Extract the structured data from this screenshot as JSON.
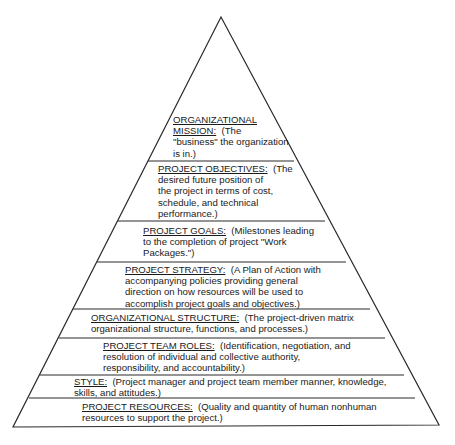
{
  "diagram": {
    "type": "pyramid",
    "line_color": "#2a2a2a",
    "layers": [
      {
        "id": "mission",
        "lines": [
          {
            "head": "ORGANIZATIONAL",
            "text": ""
          },
          {
            "head": "MISSION:",
            "text": "  (The"
          },
          {
            "head": "",
            "text": "\"business\" the organization"
          },
          {
            "head": "",
            "text": "is in.)"
          }
        ]
      },
      {
        "id": "objectives",
        "lines": [
          {
            "head": "PROJECT OBJECTIVES:",
            "text": "  (The"
          },
          {
            "head": "",
            "text": "desired future position of"
          },
          {
            "head": "",
            "text": "the project in terms of cost,"
          },
          {
            "head": "",
            "text": "schedule, and technical"
          },
          {
            "head": "",
            "text": "performance.)"
          }
        ]
      },
      {
        "id": "goals",
        "lines": [
          {
            "head": "PROJECT GOALS:",
            "text": "  (Milestones leading"
          },
          {
            "head": "",
            "text": "to the completion of project \"Work"
          },
          {
            "head": "",
            "text": "Packages.\")"
          }
        ]
      },
      {
        "id": "strategy",
        "lines": [
          {
            "head": "PROJECT STRATEGY:",
            "text": "  (A Plan of Action with"
          },
          {
            "head": "",
            "text": "accompanying policies providing general"
          },
          {
            "head": "",
            "text": "direction on how resources will be used to"
          },
          {
            "head": "",
            "text": "accomplish project goals and objectives.)"
          }
        ]
      },
      {
        "id": "structure",
        "lines": [
          {
            "head": "ORGANIZATIONAL STRUCTURE:",
            "text": "  (The project-driven matrix"
          },
          {
            "head": "",
            "text": "organizational structure, functions, and processes.)"
          }
        ]
      },
      {
        "id": "team_roles",
        "lines": [
          {
            "head": "PROJECT TEAM ROLES:",
            "text": "  (Identification, negotiation, and"
          },
          {
            "head": "",
            "text": "resolution of individual and collective authority,"
          },
          {
            "head": "",
            "text": "responsibility, and accountability.)"
          }
        ]
      },
      {
        "id": "style",
        "lines": [
          {
            "head": "STYLE:",
            "text": "  (Project manager and project team member manner, knowledge,"
          },
          {
            "head": "",
            "text": "skills, and attitudes.)"
          }
        ]
      },
      {
        "id": "resources",
        "lines": [
          {
            "head": "PROJECT RESOURCES:",
            "text": "  (Quality and quantity of human nonhuman"
          },
          {
            "head": "",
            "text": "resources to support the project.)"
          }
        ]
      }
    ]
  }
}
